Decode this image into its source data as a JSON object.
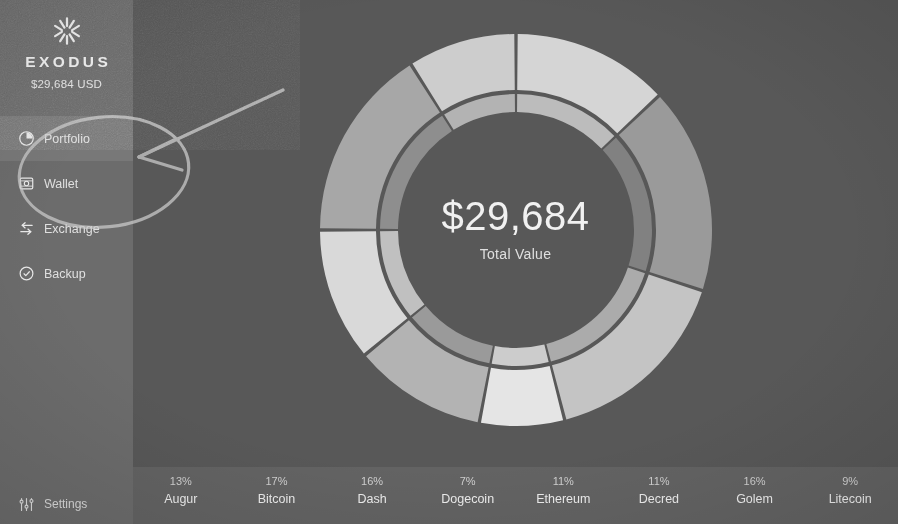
{
  "app": {
    "brand_name": "EXODUS",
    "brand_icon": "exodus-snowflake-logo",
    "total_usd": "$29,684 USD",
    "background_color": "#575757",
    "sidebar_color": "#6b6b6b",
    "active_item_color": "#787878",
    "legend_bar_color": "#626262"
  },
  "sidebar": {
    "items": [
      {
        "label": "Portfolio",
        "icon": "pie-chart-icon",
        "active": true
      },
      {
        "label": "Wallet",
        "icon": "wallet-icon",
        "active": false
      },
      {
        "label": "Exchange",
        "icon": "exchange-arrows-icon",
        "active": false
      },
      {
        "label": "Backup",
        "icon": "backup-shield-icon",
        "active": false
      }
    ],
    "settings": {
      "label": "Settings",
      "icon": "sliders-icon"
    }
  },
  "donut": {
    "center_value": "$29,684",
    "center_subtitle": "Total Value"
  },
  "annotation": {
    "type": "hand-drawn-arrow-and-ellipse",
    "description": "hand drawn ellipse circling Portfolio and Wallet with arrow pointing left"
  },
  "chart_data": {
    "type": "pie",
    "title": "$29,684",
    "subtitle": "Total Value",
    "categories": [
      "Augur",
      "Bitcoin",
      "Dash",
      "Dogecoin",
      "Ethereum",
      "Decred",
      "Golem",
      "Litecoin"
    ],
    "values": [
      13,
      17,
      16,
      7,
      11,
      11,
      16,
      9
    ],
    "unit": "%",
    "labels": [
      "13%",
      "17%",
      "16%",
      "7%",
      "11%",
      "11%",
      "16%",
      "9%"
    ],
    "colors": [
      "#d8d8d8",
      "#9b9b9b",
      "#c6c6c6",
      "#e8e8e8",
      "#b5b5b5",
      "#dcdcdc",
      "#a8a8a8",
      "#cfcfcf"
    ],
    "legend_position": "bottom",
    "grid": false,
    "donut_hole_ratio": 0.63
  }
}
